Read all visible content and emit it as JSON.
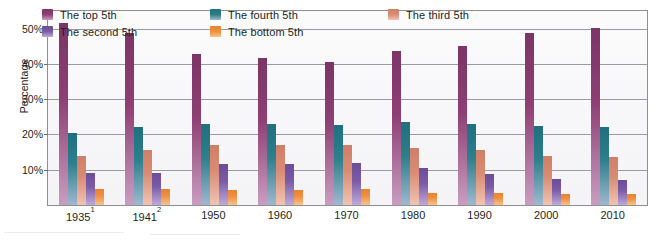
{
  "chart_data": {
    "type": "bar",
    "title": "",
    "xlabel": "",
    "ylabel": "Percentage",
    "ylim": [
      0,
      55
    ],
    "grid": true,
    "legend_position": "top",
    "y_ticks": [
      "10%",
      "20%",
      "30%",
      "40%",
      "50%"
    ],
    "y_tick_values": [
      10,
      20,
      30,
      40,
      50
    ],
    "categories": [
      "1935",
      "1941",
      "1950",
      "1960",
      "1970",
      "1980",
      "1990",
      "2000",
      "2010"
    ],
    "category_labels": [
      "1935¹",
      "1941²",
      "1950",
      "1960",
      "1970",
      "1980",
      "1990",
      "2000",
      "2010"
    ],
    "category_footnotes": [
      "1",
      "2",
      "",
      "",
      "",
      "",
      "",
      "",
      ""
    ],
    "series": [
      {
        "name": "The top 5th",
        "color": "#8e3f73",
        "color_top": "#7b3566",
        "color_bottom": "#c99ec0",
        "values": [
          51.5,
          48.8,
          42.7,
          41.8,
          40.5,
          43.7,
          45.0,
          48.7,
          50.2
        ]
      },
      {
        "name": "The fourth 5th",
        "color": "#2e7f8c",
        "color_top": "#1f6f80",
        "color_bottom": "#9fb8cf",
        "values": [
          20.5,
          22.0,
          23.0,
          23.0,
          22.8,
          23.5,
          23.0,
          22.5,
          22.2
        ]
      },
      {
        "name": "The third 5th",
        "color": "#d98b74",
        "color_top": "#cf7f67",
        "color_bottom": "#f0c4b2",
        "values": [
          14.0,
          15.5,
          17.0,
          17.0,
          17.0,
          16.3,
          15.5,
          14.0,
          13.5
        ]
      },
      {
        "name": "The second 5th",
        "color": "#7b5ba6",
        "color_top": "#6b4c99",
        "color_bottom": "#bcaad8",
        "values": [
          9.0,
          9.0,
          11.5,
          11.5,
          11.8,
          10.5,
          8.8,
          7.5,
          7.0
        ]
      },
      {
        "name": "The bottom 5th",
        "color": "#ef8f40",
        "color_top": "#e8832f",
        "color_bottom": "#f7c38e",
        "values": [
          4.5,
          4.5,
          4.2,
          4.3,
          4.5,
          3.5,
          3.3,
          3.0,
          3.0
        ]
      }
    ],
    "legend_order": [
      "The top 5th",
      "The fourth 5th",
      "The third 5th",
      "The second 5th",
      "The bottom 5th"
    ]
  }
}
